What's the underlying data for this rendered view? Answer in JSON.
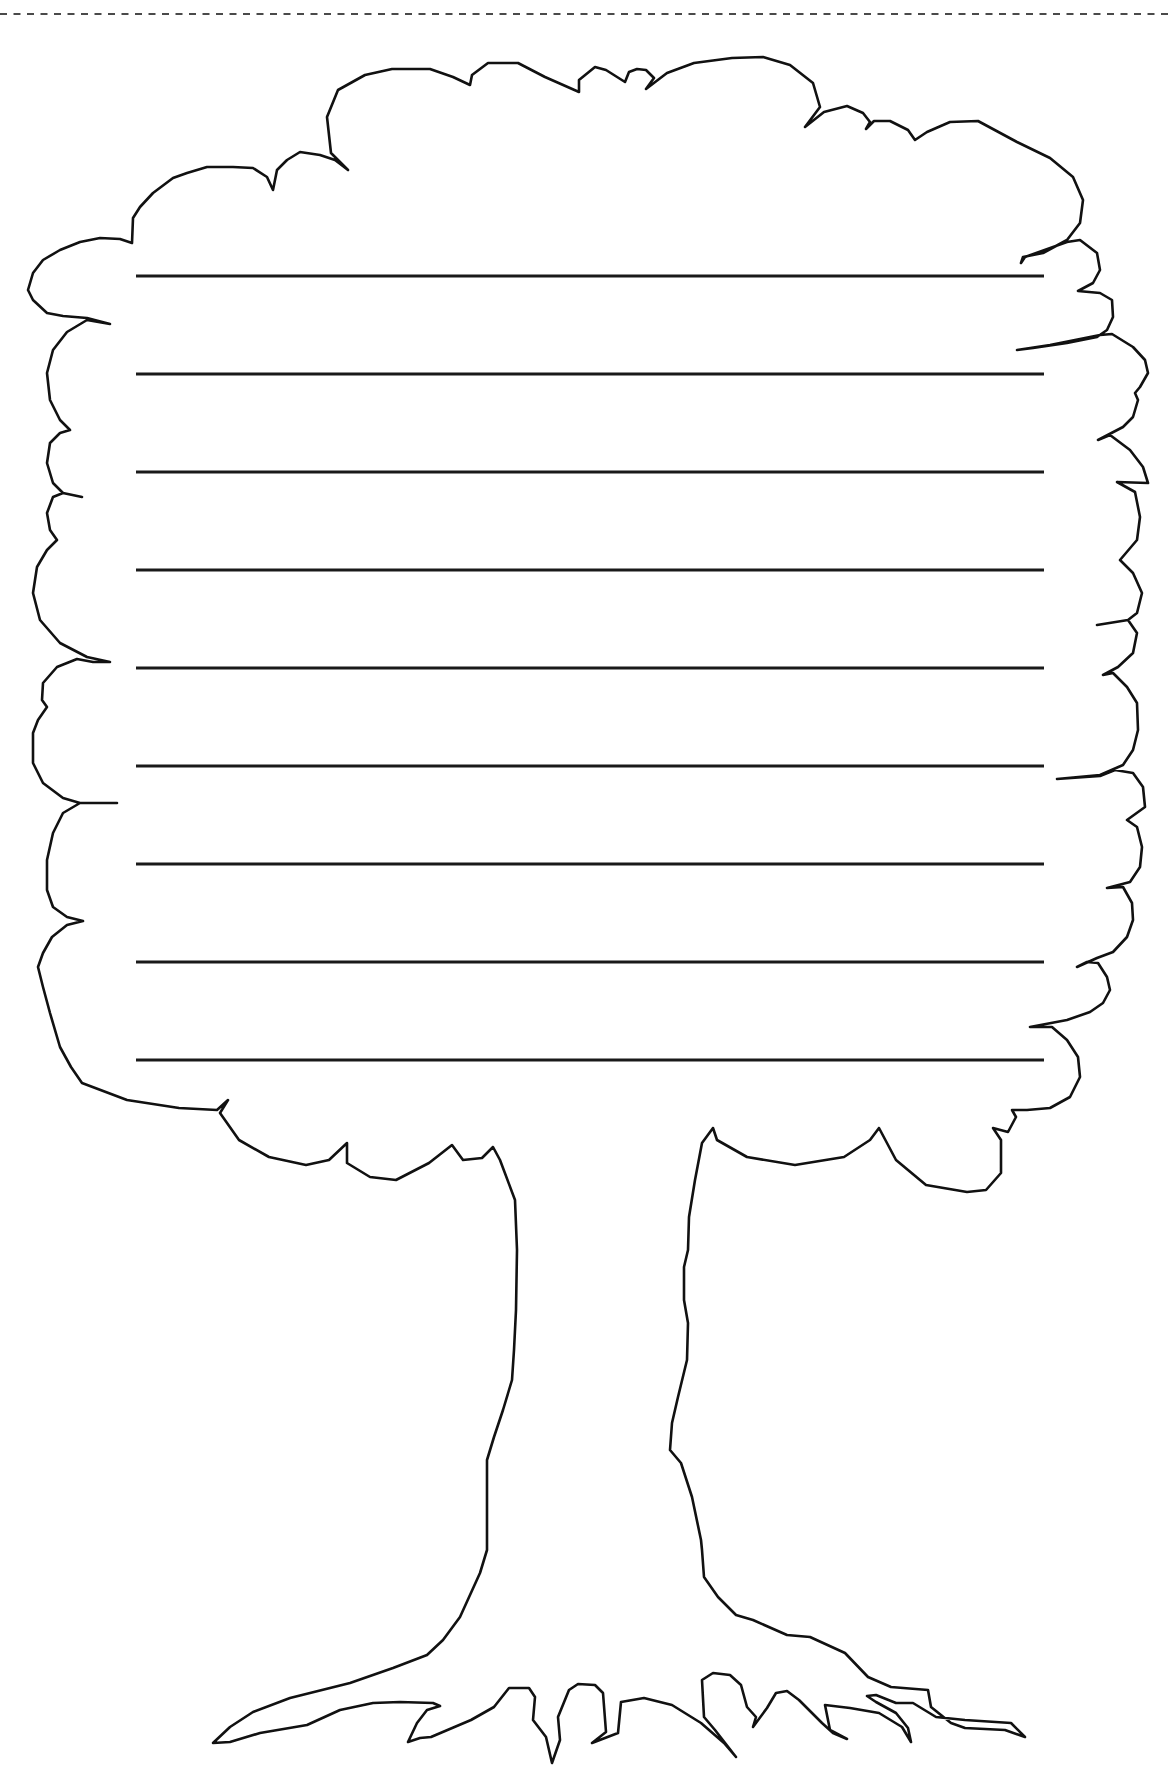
{
  "worksheet": {
    "type": "tree-shaped lined writing paper",
    "colors": {
      "background": "#ffffff",
      "outline": "#111111",
      "lines": "#1a1a1a",
      "cut_line": "#4a4a4a"
    },
    "cut_line": {
      "y": 14,
      "x1": 0,
      "x2": 1171,
      "style": "dashed"
    },
    "writing_lines": {
      "x1": 136,
      "x2": 1044,
      "ys": [
        276,
        374,
        472,
        570,
        668,
        766,
        864,
        962,
        1060
      ]
    },
    "tree_outline_points": [
      [
        28,
        290
      ],
      [
        33,
        273
      ],
      [
        43,
        260
      ],
      [
        60,
        250
      ],
      [
        80,
        242
      ],
      [
        100,
        238
      ],
      [
        120,
        239
      ],
      [
        132,
        243
      ],
      [
        133,
        218
      ],
      [
        140,
        207
      ],
      [
        153,
        193
      ],
      [
        173,
        178
      ],
      [
        187,
        173
      ],
      [
        207,
        167
      ],
      [
        233,
        167
      ],
      [
        253,
        168
      ],
      [
        267,
        177
      ],
      [
        273,
        190
      ],
      [
        277,
        170
      ],
      [
        287,
        160
      ],
      [
        300,
        152
      ],
      [
        320,
        155
      ],
      [
        335,
        160
      ],
      [
        348,
        170
      ],
      [
        331,
        153
      ],
      [
        327,
        117
      ],
      [
        338,
        90
      ],
      [
        365,
        75
      ],
      [
        392,
        69
      ],
      [
        430,
        69
      ],
      [
        453,
        77
      ],
      [
        470,
        85
      ],
      [
        472,
        75
      ],
      [
        488,
        63
      ],
      [
        518,
        63
      ],
      [
        545,
        77
      ],
      [
        579,
        92
      ],
      [
        579,
        80
      ],
      [
        595,
        67
      ],
      [
        606,
        70
      ],
      [
        625,
        82
      ],
      [
        629,
        72
      ],
      [
        637,
        69
      ],
      [
        646,
        70
      ],
      [
        654,
        78
      ],
      [
        646,
        89
      ],
      [
        667,
        73
      ],
      [
        694,
        63
      ],
      [
        732,
        58
      ],
      [
        763,
        57
      ],
      [
        790,
        65
      ],
      [
        813,
        83
      ],
      [
        820,
        107
      ],
      [
        805,
        127
      ],
      [
        824,
        112
      ],
      [
        847,
        106
      ],
      [
        863,
        113
      ],
      [
        870,
        122
      ],
      [
        866,
        129
      ],
      [
        874,
        121
      ],
      [
        890,
        121
      ],
      [
        908,
        130
      ],
      [
        915,
        140
      ],
      [
        927,
        132
      ],
      [
        950,
        122
      ],
      [
        978,
        121
      ],
      [
        1017,
        142
      ],
      [
        1050,
        158
      ],
      [
        1073,
        177
      ],
      [
        1083,
        200
      ],
      [
        1080,
        223
      ],
      [
        1067,
        240
      ],
      [
        1043,
        253
      ],
      [
        1023,
        257
      ],
      [
        1021,
        263
      ],
      [
        1025,
        257
      ],
      [
        1067,
        242
      ],
      [
        1080,
        240
      ],
      [
        1097,
        253
      ],
      [
        1100,
        270
      ],
      [
        1093,
        283
      ],
      [
        1078,
        291
      ],
      [
        1100,
        293
      ],
      [
        1112,
        300
      ],
      [
        1113,
        317
      ],
      [
        1107,
        330
      ],
      [
        1097,
        337
      ],
      [
        1067,
        343
      ],
      [
        1033,
        348
      ],
      [
        1017,
        350
      ],
      [
        1050,
        345
      ],
      [
        1100,
        335
      ],
      [
        1112,
        334
      ],
      [
        1133,
        347
      ],
      [
        1145,
        360
      ],
      [
        1148,
        373
      ],
      [
        1140,
        387
      ],
      [
        1135,
        393
      ],
      [
        1138,
        400
      ],
      [
        1133,
        417
      ],
      [
        1123,
        427
      ],
      [
        1098,
        440
      ],
      [
        1110,
        435
      ],
      [
        1130,
        450
      ],
      [
        1143,
        467
      ],
      [
        1148,
        483
      ],
      [
        1117,
        482
      ],
      [
        1135,
        492
      ],
      [
        1140,
        517
      ],
      [
        1137,
        540
      ],
      [
        1120,
        560
      ],
      [
        1133,
        573
      ],
      [
        1142,
        593
      ],
      [
        1137,
        613
      ],
      [
        1128,
        620
      ],
      [
        1097,
        625
      ],
      [
        1128,
        620
      ],
      [
        1137,
        633
      ],
      [
        1133,
        653
      ],
      [
        1118,
        667
      ],
      [
        1103,
        675
      ],
      [
        1113,
        673
      ],
      [
        1127,
        687
      ],
      [
        1137,
        703
      ],
      [
        1138,
        730
      ],
      [
        1133,
        750
      ],
      [
        1123,
        765
      ],
      [
        1100,
        775
      ],
      [
        1057,
        779
      ],
      [
        1100,
        776
      ],
      [
        1115,
        770
      ],
      [
        1133,
        773
      ],
      [
        1143,
        787
      ],
      [
        1145,
        807
      ],
      [
        1127,
        820
      ],
      [
        1137,
        827
      ],
      [
        1142,
        847
      ],
      [
        1140,
        867
      ],
      [
        1130,
        882
      ],
      [
        1107,
        888
      ],
      [
        1123,
        887
      ],
      [
        1132,
        903
      ],
      [
        1133,
        920
      ],
      [
        1127,
        937
      ],
      [
        1113,
        952
      ],
      [
        1097,
        958
      ],
      [
        1077,
        967
      ],
      [
        1087,
        962
      ],
      [
        1098,
        963
      ],
      [
        1107,
        977
      ],
      [
        1110,
        990
      ],
      [
        1103,
        1003
      ],
      [
        1090,
        1012
      ],
      [
        1067,
        1020
      ],
      [
        1030,
        1027
      ],
      [
        1052,
        1027
      ],
      [
        1067,
        1040
      ],
      [
        1078,
        1057
      ],
      [
        1080,
        1077
      ],
      [
        1070,
        1097
      ],
      [
        1050,
        1108
      ],
      [
        1027,
        1110
      ],
      [
        1012,
        1110
      ],
      [
        1016,
        1117
      ],
      [
        1008,
        1132
      ],
      [
        993,
        1128
      ],
      [
        1001,
        1140
      ],
      [
        1001,
        1173
      ],
      [
        986,
        1190
      ],
      [
        967,
        1192
      ],
      [
        926,
        1185
      ],
      [
        896,
        1160
      ],
      [
        879,
        1128
      ],
      [
        870,
        1140
      ],
      [
        844,
        1157
      ],
      [
        795,
        1165
      ],
      [
        747,
        1157
      ],
      [
        717,
        1140
      ],
      [
        713,
        1128
      ],
      [
        702,
        1143
      ],
      [
        695,
        1180
      ],
      [
        689,
        1217
      ],
      [
        688,
        1250
      ],
      [
        684,
        1267
      ],
      [
        684,
        1300
      ],
      [
        688,
        1323
      ],
      [
        687,
        1360
      ],
      [
        678,
        1397
      ],
      [
        672,
        1423
      ],
      [
        670,
        1450
      ],
      [
        681,
        1463
      ],
      [
        692,
        1497
      ],
      [
        701,
        1540
      ],
      [
        702,
        1550
      ],
      [
        704,
        1577
      ],
      [
        718,
        1597
      ],
      [
        736,
        1615
      ],
      [
        753,
        1620
      ],
      [
        787,
        1635
      ],
      [
        810,
        1637
      ],
      [
        845,
        1653
      ],
      [
        868,
        1677
      ],
      [
        891,
        1687
      ],
      [
        928,
        1690
      ],
      [
        931,
        1707
      ],
      [
        951,
        1723
      ],
      [
        965,
        1728
      ],
      [
        1005,
        1730
      ],
      [
        1025,
        1737
      ],
      [
        1011,
        1723
      ],
      [
        965,
        1720
      ],
      [
        936,
        1717
      ],
      [
        913,
        1703
      ],
      [
        896,
        1703
      ],
      [
        876,
        1695
      ],
      [
        867,
        1696
      ],
      [
        876,
        1702
      ],
      [
        896,
        1713
      ],
      [
        908,
        1728
      ],
      [
        911,
        1742
      ],
      [
        902,
        1727
      ],
      [
        879,
        1713
      ],
      [
        850,
        1708
      ],
      [
        825,
        1705
      ],
      [
        830,
        1730
      ],
      [
        847,
        1739
      ],
      [
        833,
        1733
      ],
      [
        822,
        1723
      ],
      [
        799,
        1700
      ],
      [
        787,
        1691
      ],
      [
        776,
        1693
      ],
      [
        767,
        1708
      ],
      [
        753,
        1727
      ],
      [
        756,
        1717
      ],
      [
        747,
        1707
      ],
      [
        741,
        1685
      ],
      [
        730,
        1675
      ],
      [
        713,
        1673
      ],
      [
        702,
        1680
      ],
      [
        704,
        1717
      ],
      [
        715,
        1730
      ],
      [
        736,
        1757
      ],
      [
        724,
        1743
      ],
      [
        701,
        1723
      ],
      [
        672,
        1705
      ],
      [
        644,
        1698
      ],
      [
        621,
        1702
      ],
      [
        618,
        1733
      ],
      [
        592,
        1743
      ],
      [
        606,
        1732
      ],
      [
        603,
        1693
      ],
      [
        595,
        1685
      ],
      [
        578,
        1684
      ],
      [
        569,
        1690
      ],
      [
        558,
        1717
      ],
      [
        560,
        1740
      ],
      [
        552,
        1763
      ],
      [
        546,
        1737
      ],
      [
        533,
        1720
      ],
      [
        535,
        1697
      ],
      [
        529,
        1688
      ],
      [
        509,
        1688
      ],
      [
        494,
        1707
      ],
      [
        471,
        1720
      ],
      [
        431,
        1737
      ],
      [
        420,
        1738
      ],
      [
        408,
        1742
      ],
      [
        417,
        1723
      ],
      [
        427,
        1710
      ],
      [
        440,
        1706
      ],
      [
        433,
        1703
      ],
      [
        400,
        1702
      ],
      [
        373,
        1703
      ],
      [
        340,
        1710
      ],
      [
        307,
        1725
      ],
      [
        260,
        1733
      ],
      [
        230,
        1742
      ],
      [
        213,
        1743
      ],
      [
        230,
        1727
      ],
      [
        253,
        1712
      ],
      [
        290,
        1698
      ],
      [
        350,
        1683
      ],
      [
        393,
        1668
      ],
      [
        427,
        1655
      ],
      [
        443,
        1640
      ],
      [
        460,
        1617
      ],
      [
        480,
        1573
      ],
      [
        487,
        1550
      ],
      [
        487,
        1460
      ],
      [
        494,
        1437
      ],
      [
        503,
        1410
      ],
      [
        512,
        1380
      ],
      [
        514,
        1350
      ],
      [
        516,
        1310
      ],
      [
        517,
        1250
      ],
      [
        515,
        1200
      ],
      [
        500,
        1160
      ],
      [
        493,
        1147
      ],
      [
        482,
        1158
      ],
      [
        463,
        1160
      ],
      [
        452,
        1145
      ],
      [
        429,
        1163
      ],
      [
        396,
        1180
      ],
      [
        370,
        1177
      ],
      [
        347,
        1163
      ],
      [
        347,
        1143
      ],
      [
        329,
        1160
      ],
      [
        306,
        1165
      ],
      [
        269,
        1157
      ],
      [
        239,
        1140
      ],
      [
        220,
        1113
      ],
      [
        228,
        1100
      ],
      [
        217,
        1110
      ],
      [
        179,
        1108
      ],
      [
        127,
        1100
      ],
      [
        82,
        1083
      ],
      [
        71,
        1067
      ],
      [
        60,
        1047
      ],
      [
        50,
        1013
      ],
      [
        43,
        987
      ],
      [
        38,
        967
      ],
      [
        43,
        953
      ],
      [
        52,
        937
      ],
      [
        67,
        925
      ],
      [
        83,
        921
      ],
      [
        67,
        917
      ],
      [
        53,
        907
      ],
      [
        47,
        890
      ],
      [
        47,
        860
      ],
      [
        53,
        833
      ],
      [
        63,
        813
      ],
      [
        80,
        803
      ],
      [
        117,
        803
      ],
      [
        80,
        803
      ],
      [
        63,
        798
      ],
      [
        43,
        783
      ],
      [
        33,
        763
      ],
      [
        33,
        733
      ],
      [
        38,
        720
      ],
      [
        47,
        707
      ],
      [
        42,
        700
      ],
      [
        43,
        683
      ],
      [
        57,
        667
      ],
      [
        77,
        659
      ],
      [
        93,
        662
      ],
      [
        110,
        662
      ],
      [
        87,
        657
      ],
      [
        60,
        643
      ],
      [
        40,
        620
      ],
      [
        33,
        593
      ],
      [
        37,
        567
      ],
      [
        47,
        550
      ],
      [
        57,
        540
      ],
      [
        50,
        530
      ],
      [
        47,
        513
      ],
      [
        53,
        497
      ],
      [
        63,
        493
      ],
      [
        82,
        497
      ],
      [
        63,
        493
      ],
      [
        53,
        483
      ],
      [
        47,
        463
      ],
      [
        50,
        443
      ],
      [
        60,
        433
      ],
      [
        70,
        430
      ],
      [
        60,
        420
      ],
      [
        50,
        400
      ],
      [
        47,
        373
      ],
      [
        53,
        350
      ],
      [
        67,
        332
      ],
      [
        87,
        320
      ],
      [
        110,
        324
      ],
      [
        87,
        318
      ],
      [
        63,
        316
      ],
      [
        47,
        313
      ],
      [
        33,
        300
      ]
    ]
  }
}
